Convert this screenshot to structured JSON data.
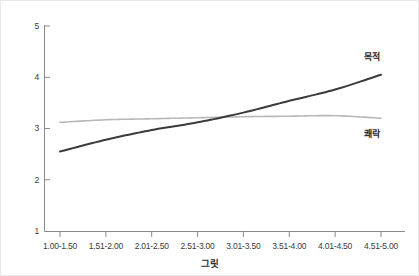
{
  "chart_data": {
    "type": "line",
    "title": "",
    "xlabel": "그릿",
    "ylabel": "",
    "categories": [
      "1.00-1.50",
      "1.51-2.00",
      "2.01-2.50",
      "2.51-3.00",
      "3.01-3.50",
      "3.51-4.00",
      "4.01-4.50",
      "4.51-5.00"
    ],
    "ylim": [
      1,
      5
    ],
    "yticks": [
      1,
      2,
      3,
      4,
      5
    ],
    "ytick_labels": [
      "1",
      "2",
      "3",
      "4",
      "5"
    ],
    "grid": false,
    "legend": "inline-end-labels",
    "series": [
      {
        "name": "목적",
        "color": "#3b3b3b",
        "width": 2.0,
        "values": [
          2.55,
          2.78,
          2.97,
          3.12,
          3.31,
          3.54,
          3.76,
          4.05
        ],
        "label_text": "목적"
      },
      {
        "name": "쾌락",
        "color": "#b8b8b8",
        "width": 1.6,
        "values": [
          3.12,
          3.17,
          3.19,
          3.21,
          3.23,
          3.24,
          3.25,
          3.2
        ],
        "label_text": "쾌락"
      }
    ],
    "annotations": [
      {
        "text": "목적",
        "x_category": "4.51-5.00",
        "y": 4.35
      },
      {
        "text": "쾌락",
        "x_category": "4.51-5.00",
        "y": 2.95
      }
    ]
  },
  "axes": {
    "x_title": "그릿",
    "y_tick_1": "1",
    "y_tick_2": "2",
    "y_tick_3": "3",
    "y_tick_4": "4",
    "y_tick_5": "5",
    "x_tick_0": "1.00-1.50",
    "x_tick_1": "1.51-2.00",
    "x_tick_2": "2.01-2.50",
    "x_tick_3": "2.51-3.00",
    "x_tick_4": "3.01-3.50",
    "x_tick_5": "3.51-4.00",
    "x_tick_6": "4.01-4.50",
    "x_tick_7": "4.51-5.00"
  },
  "labels": {
    "series_purpose": "목적",
    "series_pleasure": "쾌락"
  },
  "colors": {
    "purpose_line": "#3b3b3b",
    "pleasure_line": "#b8b8b8",
    "axis": "#8a8a8a",
    "text": "#2b2b2b"
  }
}
